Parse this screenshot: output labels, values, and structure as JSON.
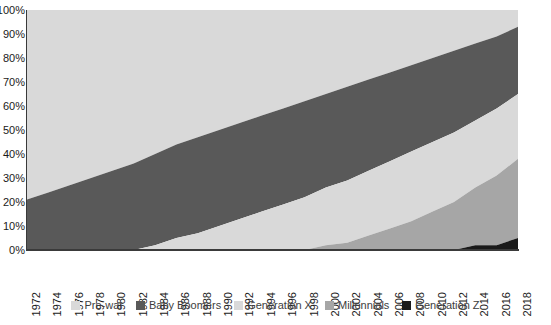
{
  "chart_data": {
    "type": "area",
    "title": "",
    "xlabel": "",
    "ylabel": "",
    "stacked": true,
    "normalized_percent": true,
    "grid": false,
    "legend_position": "bottom",
    "ylim": [
      0,
      100
    ],
    "xlim": [
      1972,
      2018
    ],
    "y_ticks": [
      0,
      10,
      20,
      30,
      40,
      50,
      60,
      70,
      80,
      90,
      100
    ],
    "y_tick_labels": [
      "0%",
      "10%",
      "20%",
      "30%",
      "40%",
      "50%",
      "60%",
      "70%",
      "80%",
      "90%",
      "100%"
    ],
    "y_tick_labels_clipped": true,
    "x": [
      1972,
      1974,
      1976,
      1978,
      1980,
      1982,
      1984,
      1986,
      1988,
      1990,
      1992,
      1994,
      1996,
      1998,
      2000,
      2002,
      2004,
      2006,
      2008,
      2010,
      2012,
      2014,
      2016,
      2018
    ],
    "x_tick_labels": [
      "1972",
      "1974",
      "1976",
      "1978",
      "1980",
      "1982",
      "1984",
      "1986",
      "1988",
      "1990",
      "1992",
      "1994",
      "1996",
      "1998",
      "2000",
      "2002",
      "2004",
      "2006",
      "2008",
      "2010",
      "2012",
      "2014",
      "2016",
      "2018"
    ],
    "series": [
      {
        "name": "Pre-war",
        "color": "#d9d9d9",
        "values": [
          79,
          76,
          73,
          70,
          67,
          64,
          60,
          56,
          53,
          50,
          47,
          44,
          41,
          38,
          35,
          32,
          29,
          26,
          23,
          20,
          17,
          14,
          11,
          7
        ]
      },
      {
        "name": "Baby Boomers",
        "color": "#595959",
        "values": [
          21,
          24,
          27,
          30,
          33,
          36,
          38,
          39,
          40,
          40,
          40,
          40,
          40,
          40,
          39,
          39,
          38,
          37,
          36,
          35,
          34,
          32,
          30,
          28
        ]
      },
      {
        "name": "Generation X",
        "color": "#d9d9d9",
        "values": [
          0,
          0,
          0,
          0,
          0,
          0,
          2,
          5,
          7,
          10,
          13,
          16,
          19,
          22,
          24,
          26,
          27,
          28,
          29,
          29,
          29,
          28,
          28,
          27
        ]
      },
      {
        "name": "Millennials",
        "color": "#a6a6a6",
        "values": [
          0,
          0,
          0,
          0,
          0,
          0,
          0,
          0,
          0,
          0,
          0,
          0,
          0,
          0,
          2,
          3,
          6,
          9,
          12,
          16,
          20,
          24,
          29,
          33
        ]
      },
      {
        "name": "Generation Z",
        "color": "#1a1a1a",
        "values": [
          0,
          0,
          0,
          0,
          0,
          0,
          0,
          0,
          0,
          0,
          0,
          0,
          0,
          0,
          0,
          0,
          0,
          0,
          0,
          0,
          0,
          2,
          2,
          5
        ]
      }
    ]
  },
  "axis": {
    "color": "#3a3a3a"
  }
}
